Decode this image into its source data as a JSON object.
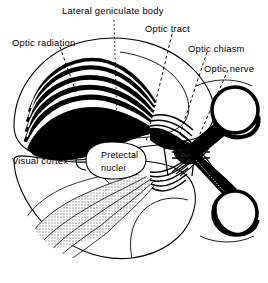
{
  "figure": {
    "type": "anatomical-diagram",
    "background_color": "#ffffff",
    "ink_color": "#000000",
    "stipple_color": "#9a9a9a"
  },
  "labels": {
    "lateral_geniculate_body": "Lateral geniculate body",
    "optic_radiation": "Optic radiation",
    "optic_tract": "Optic tract",
    "optic_chiasm": "Optic chiasm",
    "optic_nerve": "Optic nerve",
    "visual_cortex": "Visual cortex",
    "pretectal_line1": "Pretectal",
    "pretectal_line2": "nuclei"
  },
  "leaders": [
    {
      "name": "leader-lateral-geniculate-body",
      "style": "dotted-vertical"
    },
    {
      "name": "leader-optic-radiation",
      "style": "dashed-diagonal"
    },
    {
      "name": "leader-optic-tract",
      "style": "dashed-diagonal"
    },
    {
      "name": "leader-optic-chiasm",
      "style": "dashed-diagonal"
    },
    {
      "name": "leader-optic-nerve",
      "style": "dashed-diagonal"
    },
    {
      "name": "leader-visual-cortex",
      "style": "solid-bracket"
    },
    {
      "name": "leader-pretectal-nuclei",
      "style": "solid-oval"
    }
  ],
  "structures": [
    {
      "name": "brain-outline-upper",
      "fill": "none"
    },
    {
      "name": "brain-outline-lower",
      "fill": "none"
    },
    {
      "name": "optic-radiation-bands-upper",
      "fill": "#000000"
    },
    {
      "name": "optic-radiation-bands-lower",
      "fill": "#9a9a9a"
    },
    {
      "name": "optic-tract-upper",
      "fill": "#000000"
    },
    {
      "name": "optic-tract-lower",
      "fill": "#000000"
    },
    {
      "name": "optic-chiasm",
      "fill": "#000000"
    },
    {
      "name": "optic-nerve-upper",
      "fill": "#000000"
    },
    {
      "name": "optic-nerve-lower",
      "fill": "#000000"
    },
    {
      "name": "eye-upper",
      "fill": "#ffffff"
    },
    {
      "name": "eye-lower",
      "fill": "#ffffff"
    },
    {
      "name": "pretectal-nuclei-oval",
      "fill": "#ffffff"
    }
  ]
}
